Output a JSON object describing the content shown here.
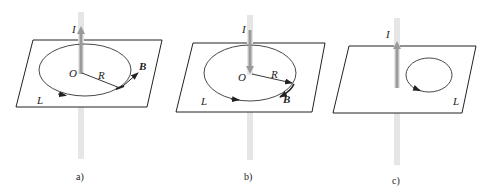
{
  "figure": {
    "colors": {
      "background": "#ffffff",
      "plane_outline": "#222222",
      "loop": "#333333",
      "rod_light": "#e4e4e4",
      "rod_arrow": "#9a9a9a",
      "text": "#222222"
    },
    "panels": [
      {
        "id": "a",
        "caption": "a)",
        "current_label": "I",
        "current_direction": "up",
        "center_label": "O",
        "radius_label": "R",
        "field_label": "B",
        "loop_label": "L",
        "loop_encloses_current": true
      },
      {
        "id": "b",
        "caption": "b)",
        "current_label": "I",
        "current_direction": "down",
        "center_label": "O",
        "radius_label": "R",
        "field_label": "B",
        "loop_label": "L",
        "loop_encloses_current": true
      },
      {
        "id": "c",
        "caption": "c)",
        "current_label": "I",
        "current_direction": "up",
        "loop_label": "L",
        "loop_encloses_current": false
      }
    ]
  }
}
